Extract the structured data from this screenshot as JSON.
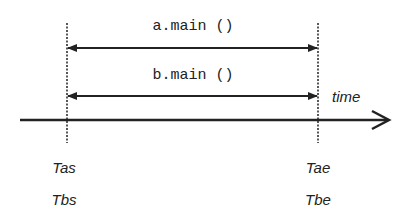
{
  "diagram": {
    "type": "timeline",
    "axis_label": "time",
    "intervals": [
      {
        "label": "a.main ()",
        "start": "Tas",
        "end": "Tae"
      },
      {
        "label": "b.main ()",
        "start": "Tbs",
        "end": "Tbe"
      }
    ],
    "start_labels": [
      "Tas",
      "Tbs"
    ],
    "end_labels": [
      "Tae",
      "Tbe"
    ],
    "colors": {
      "line": "#222222",
      "background": "#ffffff"
    }
  }
}
